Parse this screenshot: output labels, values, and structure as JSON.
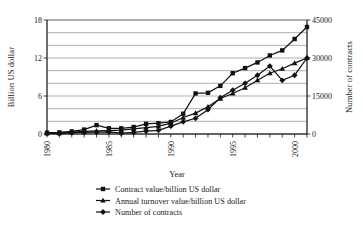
{
  "chart_data": {
    "type": "line",
    "title": "",
    "xlabel": "Year",
    "ylabel": "Billion US dollar",
    "y2label": "Number of contracts",
    "grid": true,
    "legend_position": "bottom",
    "xlim": [
      1980,
      2001
    ],
    "ylim": [
      0,
      18
    ],
    "y2lim": [
      0,
      45000
    ],
    "x": [
      1980,
      1981,
      1982,
      1983,
      1984,
      1985,
      1986,
      1987,
      1988,
      1989,
      1990,
      1991,
      1992,
      1993,
      1994,
      1995,
      1996,
      1997,
      1998,
      1999,
      2000,
      2001
    ],
    "xticks": [
      1980,
      1985,
      1990,
      1995,
      2000
    ],
    "xticklabels": [
      "1980",
      "1985",
      "1990",
      "1995",
      "2000"
    ],
    "yticks": [
      0,
      6,
      12,
      18
    ],
    "yticklabels": [
      "0",
      "6",
      "12",
      "18"
    ],
    "ygridlines": [
      0,
      2,
      4,
      6,
      8,
      10,
      12,
      14,
      16,
      18
    ],
    "y2ticks": [
      0,
      15000,
      30000,
      45000
    ],
    "y2ticklabels": [
      "0",
      "15000",
      "30000",
      "45000"
    ],
    "series": [
      {
        "name": "Contract value/billion US dollar",
        "marker": "square",
        "axis": "left",
        "units": "billion US dollar",
        "values": [
          0.2,
          0.25,
          0.4,
          0.7,
          1.4,
          0.9,
          0.9,
          1.1,
          1.6,
          1.7,
          1.9,
          3.2,
          6.4,
          6.5,
          7.6,
          9.6,
          10.4,
          11.3,
          12.4,
          13.2,
          15.0,
          16.9
        ]
      },
      {
        "name": "Annual turnover value/billion US dollar",
        "marker": "triangle",
        "axis": "left",
        "units": "billion US dollar",
        "values": [
          0.1,
          0.15,
          0.3,
          0.4,
          0.5,
          0.55,
          0.6,
          0.8,
          1.0,
          1.2,
          1.7,
          2.6,
          3.3,
          4.3,
          5.6,
          6.4,
          7.3,
          8.5,
          9.6,
          10.3,
          11.2,
          12.0
        ]
      },
      {
        "name": "Number of contracts",
        "marker": "diamond",
        "axis": "right",
        "units": "contracts",
        "values": [
          300,
          150,
          500,
          600,
          700,
          800,
          300,
          600,
          1100,
          1400,
          3100,
          4800,
          6200,
          9600,
          14300,
          17300,
          20000,
          23200,
          26800,
          21200,
          23200,
          30000
        ]
      }
    ]
  },
  "legend": {
    "items": [
      {
        "label": "Contract value/billion US dollar",
        "marker": "square"
      },
      {
        "label": "Annual turnover value/billion US dollar",
        "marker": "triangle"
      },
      {
        "label": "Number of contracts",
        "marker": "diamond"
      }
    ]
  }
}
